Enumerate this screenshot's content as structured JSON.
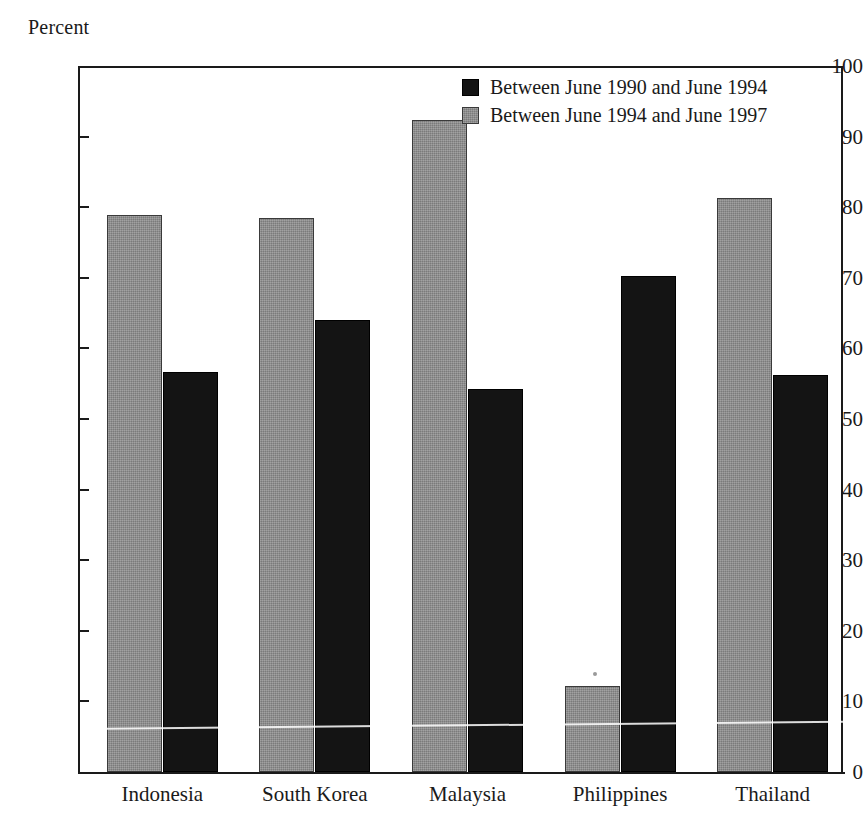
{
  "chart_data": {
    "type": "bar",
    "title": "",
    "ylabel": "Percent",
    "xlabel": "",
    "ylim": [
      0,
      100
    ],
    "yticks": [
      0,
      10,
      20,
      30,
      40,
      50,
      60,
      70,
      80,
      90,
      100
    ],
    "grid": false,
    "legend_position": "top-right",
    "categories": [
      "Indonesia",
      "South Korea",
      "Malaysia",
      "Philippines",
      "Thailand"
    ],
    "series": [
      {
        "name": "Between June 1990 and June 1994",
        "color": "#141414",
        "values": [
          56.6,
          64.0,
          54.2,
          70.3,
          56.3
        ]
      },
      {
        "name": "Between June 1994 and June 1997",
        "color": "#8b8b8b",
        "values": [
          78.9,
          78.5,
          92.4,
          12.2,
          81.3
        ]
      }
    ],
    "series_draw_order": [
      "Between June 1994 and June 1997",
      "Between June 1990 and June 1994"
    ]
  },
  "legend": {
    "items": [
      {
        "label": "Between June 1990 and June 1994",
        "swatch": "dark"
      },
      {
        "label": "Between June 1994 and June 1997",
        "swatch": "gray"
      }
    ]
  }
}
